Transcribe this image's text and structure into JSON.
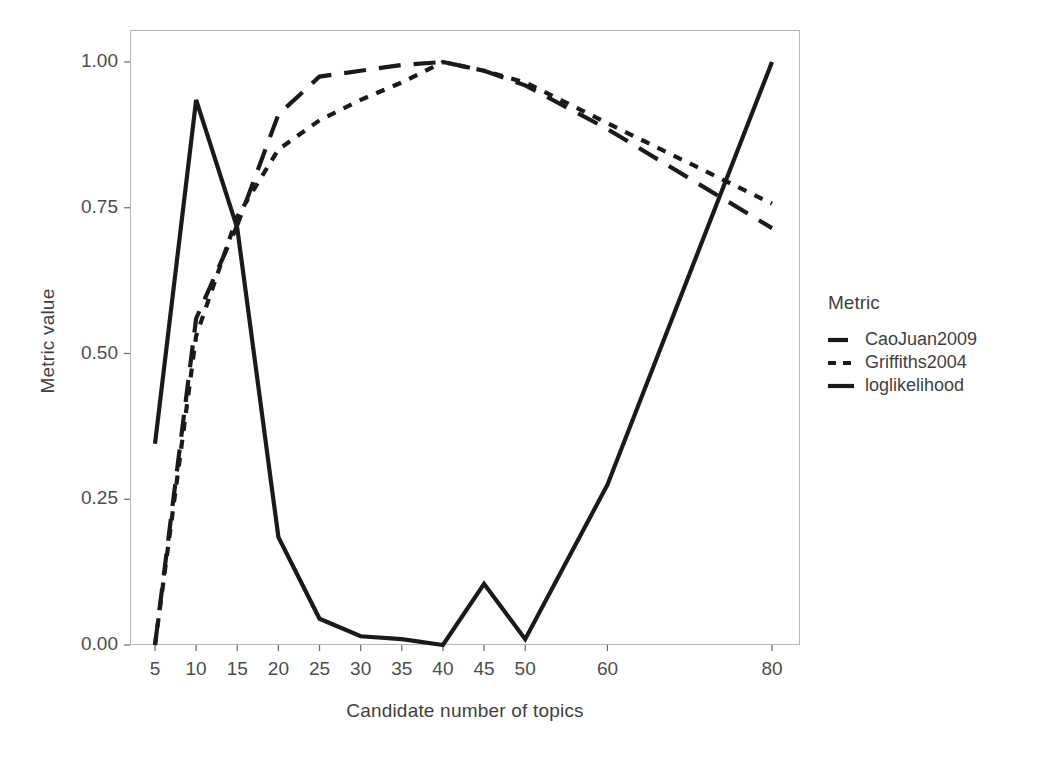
{
  "chart_data": {
    "type": "line",
    "title": "",
    "xlabel": "Candidate number of topics",
    "ylabel": "Metric value",
    "xlim": [
      5,
      80
    ],
    "ylim": [
      0.0,
      1.0
    ],
    "grid": false,
    "legend_position": "right",
    "legend_title": "Metric",
    "xticks": [
      5,
      10,
      15,
      20,
      25,
      30,
      35,
      40,
      45,
      50,
      60,
      80
    ],
    "xtick_labels": [
      "5",
      "10",
      "15",
      "20",
      "25",
      "30",
      "35",
      "40",
      "45",
      "50",
      "60",
      "80"
    ],
    "yticks": [
      0.0,
      0.25,
      0.5,
      0.75,
      1.0
    ],
    "ytick_labels": [
      "0.00",
      "0.25",
      "0.50",
      "0.75",
      "1.00"
    ],
    "x": [
      5,
      10,
      15,
      20,
      25,
      30,
      35,
      40,
      45,
      50,
      60,
      80
    ],
    "series": [
      {
        "name": "CaoJuan2009",
        "style": "dashed",
        "color": "#1a1a1a",
        "values": [
          0.0,
          0.56,
          0.72,
          0.91,
          0.975,
          0.985,
          0.995,
          1.0,
          0.985,
          0.96,
          0.885,
          0.715
        ]
      },
      {
        "name": "Griffiths2004",
        "style": "dotted",
        "color": "#1a1a1a",
        "values": [
          0.0,
          0.53,
          0.735,
          0.85,
          0.9,
          0.935,
          0.965,
          1.0,
          0.985,
          0.965,
          0.895,
          0.757
        ]
      },
      {
        "name": "loglikelihood",
        "style": "solid",
        "color": "#1a1a1a",
        "values": [
          0.345,
          0.935,
          0.715,
          0.185,
          0.045,
          0.015,
          0.01,
          0.0,
          0.105,
          0.01,
          0.275,
          1.0
        ]
      }
    ]
  },
  "legend": {
    "title": "Metric",
    "entries": [
      {
        "label": "CaoJuan2009",
        "key": "dashed-line-key"
      },
      {
        "label": "Griffiths2004",
        "key": "dotted-line-key"
      },
      {
        "label": "loglikelihood",
        "key": "solid-line-key"
      }
    ]
  },
  "axes": {
    "x_title": "Candidate number of topics",
    "y_title": "Metric value"
  },
  "colors": {
    "line": "#1a1a1a",
    "panel_border": "#b3b3b3",
    "text": "#4d4d4d",
    "background": "#ffffff"
  }
}
